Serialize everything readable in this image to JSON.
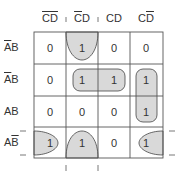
{
  "diagram": {
    "type": "karnaugh-map",
    "columns": [
      {
        "label_parts": [
          {
            "t": "C",
            "bar": true
          },
          {
            "t": "D",
            "bar": true
          }
        ]
      },
      {
        "label_parts": [
          {
            "t": "C",
            "bar": true
          },
          {
            "t": "D",
            "bar": false
          }
        ]
      },
      {
        "label_parts": [
          {
            "t": "C",
            "bar": false
          },
          {
            "t": "D",
            "bar": false
          }
        ]
      },
      {
        "label_parts": [
          {
            "t": "C",
            "bar": false
          },
          {
            "t": "D",
            "bar": true
          }
        ]
      }
    ],
    "col_text": [
      "C",
      "D",
      "C",
      "D",
      "C",
      "D",
      "C",
      "D"
    ],
    "rows": [
      {
        "a": "A",
        "b": "B",
        "a_bar": true,
        "b_bar": true
      },
      {
        "a": "A",
        "b": "B",
        "a_bar": true,
        "b_bar": false
      },
      {
        "a": "A",
        "b": "B",
        "a_bar": false,
        "b_bar": false
      },
      {
        "a": "A",
        "b": "B",
        "a_bar": false,
        "b_bar": true
      }
    ],
    "cells": [
      [
        "0",
        "1",
        "0",
        "0"
      ],
      [
        "0",
        "1",
        "1",
        "1"
      ],
      [
        "0",
        "0",
        "0",
        "1"
      ],
      [
        "1",
        "1",
        "0",
        "1"
      ]
    ],
    "groups": [
      {
        "name": "wrap-vertical-column-2",
        "cells": [
          [
            0,
            1
          ],
          [
            3,
            1
          ]
        ]
      },
      {
        "name": "row-2-columns-2-3",
        "cells": [
          [
            1,
            1
          ],
          [
            1,
            2
          ]
        ]
      },
      {
        "name": "column-4-rows-2-3",
        "cells": [
          [
            1,
            3
          ],
          [
            2,
            3
          ]
        ]
      },
      {
        "name": "wrap-horizontal-row-4",
        "cells": [
          [
            3,
            0
          ],
          [
            3,
            3
          ]
        ]
      }
    ],
    "fill_color": "#d9d9d9",
    "line_color": "#555555"
  }
}
